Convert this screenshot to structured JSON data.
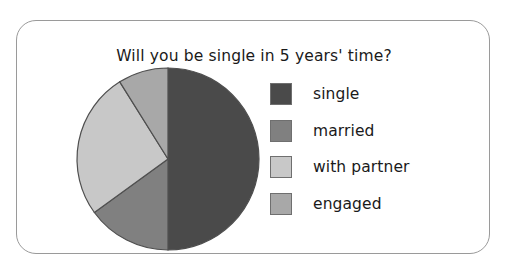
{
  "card": {
    "border_color": "#9a9a9a",
    "background": "#ffffff"
  },
  "chart_data": {
    "type": "pie",
    "title": "Will you be single in 5 years' time?",
    "xlabel": "",
    "ylabel": "",
    "legend_position": "right",
    "grid": false,
    "start_angle_deg": 0,
    "direction": "clockwise",
    "categories": [
      "single",
      "married",
      "with partner",
      "engaged"
    ],
    "values": [
      50,
      15,
      26,
      9
    ],
    "unit": "percent",
    "colors": [
      "#4a4a4a",
      "#808080",
      "#c8c8c8",
      "#a8a8a8"
    ],
    "slices": [
      {
        "label": "single",
        "value": 50,
        "angle_deg": 180,
        "color": "#4a4a4a",
        "start_deg": 0,
        "end_deg": 180
      },
      {
        "label": "married",
        "value": 15,
        "angle_deg": 54,
        "color": "#808080",
        "start_deg": 180,
        "end_deg": 234
      },
      {
        "label": "with partner",
        "value": 26,
        "angle_deg": 94,
        "color": "#c8c8c8",
        "start_deg": 234,
        "end_deg": 328
      },
      {
        "label": "engaged",
        "value": 9,
        "angle_deg": 32,
        "color": "#a8a8a8",
        "start_deg": 328,
        "end_deg": 360
      }
    ],
    "stroke_color": "#4f4f4f"
  },
  "legend": {
    "items": [
      {
        "label": "single",
        "color": "#4a4a4a"
      },
      {
        "label": "married",
        "color": "#808080"
      },
      {
        "label": "with partner",
        "color": "#c8c8c8"
      },
      {
        "label": "engaged",
        "color": "#a8a8a8"
      }
    ]
  }
}
